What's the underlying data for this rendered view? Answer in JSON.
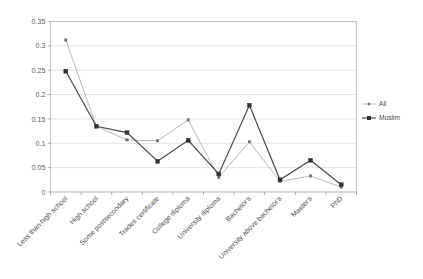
{
  "chart_data": {
    "type": "line",
    "title": "",
    "subtitle": "",
    "xlabel": "",
    "ylabel": "",
    "ylim": [
      0,
      0.35
    ],
    "yticks": [
      "0",
      "0.05",
      "0.1",
      "0.15",
      "0.2",
      "0.25",
      "0.3",
      "0.35"
    ],
    "ytick_values": [
      0,
      0.05,
      0.1,
      0.15,
      0.2,
      0.25,
      0.3,
      0.35
    ],
    "grid": true,
    "legend_position": "right",
    "categories": [
      "Less than high school",
      "High school",
      "Some postsecondary",
      "Trades certificate",
      "College diploma",
      "University diploma",
      "Bachelor's",
      "University above bachelor's",
      "Master's",
      "PhD"
    ],
    "series": [
      {
        "name": "All",
        "color": "#b9b9b9",
        "marker_color": "#6e6e6e",
        "values": [
          0.312,
          0.135,
          0.107,
          0.105,
          0.148,
          0.03,
          0.103,
          0.022,
          0.033,
          0.01
        ]
      },
      {
        "name": "Muslim",
        "color": "#4a4a4a",
        "marker_color": "#333333",
        "values": [
          0.248,
          0.135,
          0.122,
          0.063,
          0.106,
          0.037,
          0.178,
          0.025,
          0.065,
          0.015
        ]
      }
    ]
  },
  "legend": {
    "items": [
      {
        "label": "All"
      },
      {
        "label": "Muslim"
      }
    ]
  },
  "colors": {
    "all_series": "#b9b9b9",
    "muslim_series": "#4a4a4a",
    "gridline": "#d9d9d9",
    "axis": "#9a9a9a",
    "background": "#ffffff"
  }
}
